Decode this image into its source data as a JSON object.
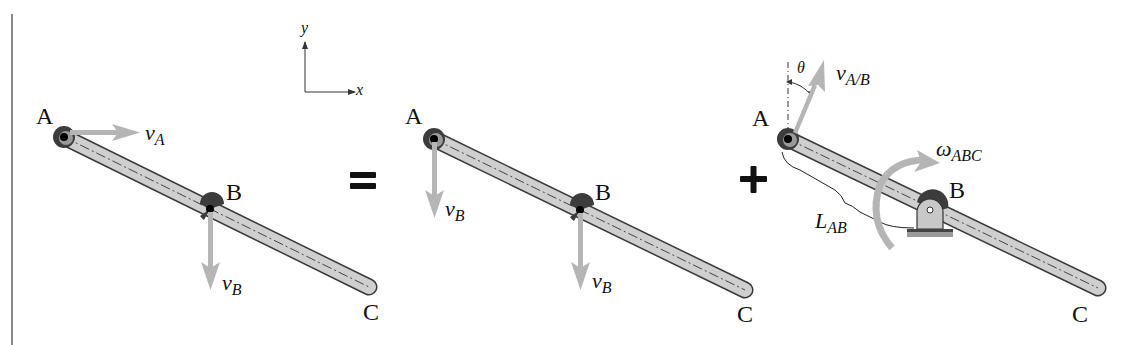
{
  "figure": {
    "operators": {
      "equals": "=",
      "plus": "+"
    },
    "axes": {
      "x_label": "x",
      "y_label": "y"
    },
    "panels": [
      {
        "id": "general-motion",
        "points": {
          "A": "A",
          "B": "B",
          "C": "C"
        },
        "vectors": [
          {
            "name": "v",
            "sub": "A",
            "direction": "right"
          },
          {
            "name": "v",
            "sub": "B",
            "direction": "down"
          }
        ]
      },
      {
        "id": "translation",
        "points": {
          "A": "A",
          "B": "B",
          "C": "C"
        },
        "vectors": [
          {
            "name": "v",
            "sub": "B",
            "direction": "down",
            "at": "A"
          },
          {
            "name": "v",
            "sub": "B",
            "direction": "down",
            "at": "B"
          }
        ]
      },
      {
        "id": "rotation-about-B",
        "points": {
          "A": "A",
          "B": "B",
          "C": "C"
        },
        "vectors": [
          {
            "name": "v",
            "sub": "A/B",
            "direction": "up-right",
            "at": "A"
          }
        ],
        "angle": "θ",
        "angular_velocity": {
          "name": "ω",
          "sub": "ABC"
        },
        "length": {
          "name": "L",
          "sub": "AB"
        }
      }
    ],
    "colors": {
      "rod_fill": "#cfcfcf",
      "rod_stroke": "#3a3a3a",
      "vector": "#b5b5b5",
      "pin_dark": "#3c3c3c",
      "text": "#111111"
    }
  }
}
